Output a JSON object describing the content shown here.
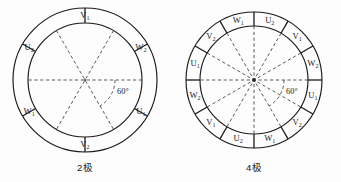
{
  "figure": {
    "background_color": "#fdfdfd",
    "line_color": "#1a1a1a",
    "dash_color": "#3a3a3a"
  },
  "diagrams": [
    {
      "id": "two-pole",
      "caption": "2极",
      "pole_count": 2,
      "segment_count": 6,
      "angle_label": "60°",
      "center": {
        "x": 85,
        "y": 80
      },
      "outer_radius": 72,
      "inner_radius": 57,
      "divider_angles_deg": [
        30,
        90,
        150,
        210,
        270,
        330
      ],
      "dashed_diameter_angles_deg": [
        0,
        60,
        120
      ],
      "segments": [
        {
          "label_base": "V",
          "label_sub": "1",
          "angle_deg": 90,
          "text": "V₁"
        },
        {
          "label_base": "W",
          "label_sub": "2",
          "angle_deg": 30,
          "text": "W₂"
        },
        {
          "label_base": "U",
          "label_sub": "1",
          "angle_deg": 330,
          "text": "U₁"
        },
        {
          "label_base": "V",
          "label_sub": "2",
          "angle_deg": 270,
          "text": "V₂"
        },
        {
          "label_base": "W",
          "label_sub": "1",
          "angle_deg": 210,
          "text": "W₁"
        },
        {
          "label_base": "U",
          "label_sub": "2",
          "angle_deg": 150,
          "text": "U₂"
        }
      ]
    },
    {
      "id": "four-pole",
      "caption": "4极",
      "pole_count": 4,
      "segment_count": 12,
      "angle_label": "60°",
      "center": {
        "x": 254,
        "y": 80
      },
      "outer_radius": 68,
      "inner_radius": 54,
      "divider_angles_deg": [
        0,
        30,
        60,
        90,
        120,
        150,
        180,
        210,
        240,
        270,
        300,
        330
      ],
      "dashed_diameter_angles_deg": [
        0,
        30,
        60,
        90,
        120,
        150
      ],
      "segments": [
        {
          "label_base": "U",
          "label_sub": "2",
          "angle_deg": 75,
          "text": "U₂"
        },
        {
          "label_base": "V",
          "label_sub": "1",
          "angle_deg": 45,
          "text": "V₁"
        },
        {
          "label_base": "W",
          "label_sub": "2",
          "angle_deg": 15,
          "text": "W₂"
        },
        {
          "label_base": "U",
          "label_sub": "1",
          "angle_deg": 345,
          "text": "U₁"
        },
        {
          "label_base": "V",
          "label_sub": "2",
          "angle_deg": 315,
          "text": "V₂"
        },
        {
          "label_base": "W",
          "label_sub": "1",
          "angle_deg": 285,
          "text": "W₁"
        },
        {
          "label_base": "U",
          "label_sub": "2",
          "angle_deg": 255,
          "text": "U₂"
        },
        {
          "label_base": "V",
          "label_sub": "1",
          "angle_deg": 225,
          "text": "V₁"
        },
        {
          "label_base": "W",
          "label_sub": "2",
          "angle_deg": 195,
          "text": "W₂"
        },
        {
          "label_base": "U",
          "label_sub": "1",
          "angle_deg": 165,
          "text": "U₁"
        },
        {
          "label_base": "V",
          "label_sub": "2",
          "angle_deg": 135,
          "text": "V₂"
        },
        {
          "label_base": "W",
          "label_sub": "1",
          "angle_deg": 105,
          "text": "W₁"
        }
      ]
    }
  ]
}
